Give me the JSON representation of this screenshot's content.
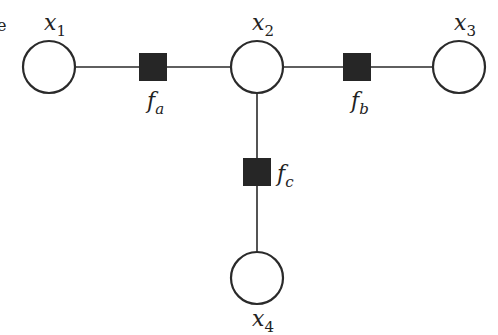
{
  "diagram": {
    "type": "factor-graph",
    "colors": {
      "stroke": "#2a2a2a",
      "factor_fill": "#262626",
      "variable_fill": "#ffffff",
      "background": "#ffffff"
    },
    "variables": [
      {
        "id": "x1",
        "base": "x",
        "sub": "1",
        "cx": 49,
        "cy": 67,
        "r": 26,
        "label_x": 44,
        "label_y": 30
      },
      {
        "id": "x2",
        "base": "x",
        "sub": "2",
        "cx": 257,
        "cy": 67,
        "r": 26,
        "label_x": 252,
        "label_y": 30
      },
      {
        "id": "x3",
        "base": "x",
        "sub": "3",
        "cx": 459,
        "cy": 67,
        "r": 26,
        "label_x": 454,
        "label_y": 30
      },
      {
        "id": "x4",
        "base": "x",
        "sub": "4",
        "cx": 257,
        "cy": 278,
        "r": 26,
        "label_x": 252,
        "label_y": 326
      }
    ],
    "factors": [
      {
        "id": "fa",
        "base": "f",
        "sub": "a",
        "cx": 153,
        "cy": 67,
        "size": 28,
        "label_x": 147,
        "label_y": 108
      },
      {
        "id": "fb",
        "base": "f",
        "sub": "b",
        "cx": 357,
        "cy": 67,
        "size": 28,
        "label_x": 351,
        "label_y": 108
      },
      {
        "id": "fc",
        "base": "f",
        "sub": "c",
        "cx": 257,
        "cy": 172,
        "size": 28,
        "label_x": 277,
        "label_y": 181
      }
    ],
    "edges": [
      {
        "from": "x1",
        "to": "fa"
      },
      {
        "from": "fa",
        "to": "x2"
      },
      {
        "from": "x2",
        "to": "fb"
      },
      {
        "from": "fb",
        "to": "x3"
      },
      {
        "from": "x2",
        "to": "fc"
      },
      {
        "from": "fc",
        "to": "x4"
      }
    ],
    "edge_fragment": {
      "text": "e",
      "x": -3,
      "y": 31
    }
  }
}
